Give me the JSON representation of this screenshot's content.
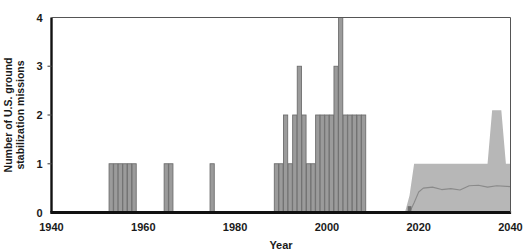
{
  "chart_data": {
    "type": "bar",
    "title": "",
    "subtitle": "",
    "xlabel": "Year",
    "ylabel": "Number of U.S. ground stabilization missions",
    "ylabel_line1": "Number of U.S. ground",
    "ylabel_line2": "stabilization missions",
    "xlim": [
      1940,
      2040
    ],
    "ylim": [
      0,
      4
    ],
    "xticks": [
      1940,
      1960,
      1980,
      2000,
      2020,
      2040
    ],
    "xtick_labels": [
      "1940",
      "1960",
      "1980",
      "2000",
      "2020",
      "2040"
    ],
    "yticks": [
      0,
      1,
      2,
      3,
      4
    ],
    "ytick_labels": [
      "0",
      "1",
      "2",
      "3",
      "4"
    ],
    "grid": false,
    "legend": null,
    "bar_color": "#9b9b9b",
    "bar_edge_color": "#6e6e6e",
    "band_color": "#b7b7b7",
    "median_line_color": "#8a8a8a",
    "axis_color": "#111111",
    "categories": [
      1953,
      1954,
      1955,
      1956,
      1957,
      1958,
      1965,
      1966,
      1975,
      1989,
      1990,
      1991,
      1992,
      1993,
      1994,
      1995,
      1996,
      1997,
      1998,
      1999,
      2000,
      2001,
      2002,
      2003,
      2004,
      2005,
      2006,
      2007,
      2008
    ],
    "values": [
      1,
      1,
      1,
      1,
      1,
      1,
      1,
      1,
      1,
      1,
      1,
      2,
      1,
      2,
      3,
      2,
      1,
      1,
      2,
      2,
      2,
      2,
      3,
      4,
      2,
      2,
      2,
      2,
      2
    ],
    "clipped_bars": [
      {
        "x": 2003,
        "value": 4,
        "note": "extends to or beyond top of axis"
      }
    ],
    "projection": {
      "label": "projected range",
      "start_year": 2017,
      "end_year": 2040,
      "upper_band": [
        {
          "year": 2017,
          "value": 0.0
        },
        {
          "year": 2018,
          "value": 0.35
        },
        {
          "year": 2019,
          "value": 1.0
        },
        {
          "year": 2020,
          "value": 1.0
        },
        {
          "year": 2025,
          "value": 1.0
        },
        {
          "year": 2030,
          "value": 1.0
        },
        {
          "year": 2035,
          "value": 1.0
        },
        {
          "year": 2036,
          "value": 2.1
        },
        {
          "year": 2038,
          "value": 2.1
        },
        {
          "year": 2039,
          "value": 1.0
        },
        {
          "year": 2040,
          "value": 1.0
        }
      ],
      "lower_band": 0.0,
      "median_line": [
        {
          "year": 2018,
          "value": 0.0
        },
        {
          "year": 2019,
          "value": 0.2
        },
        {
          "year": 2020,
          "value": 0.42
        },
        {
          "year": 2021,
          "value": 0.5
        },
        {
          "year": 2023,
          "value": 0.52
        },
        {
          "year": 2025,
          "value": 0.47
        },
        {
          "year": 2027,
          "value": 0.49
        },
        {
          "year": 2029,
          "value": 0.46
        },
        {
          "year": 2031,
          "value": 0.55
        },
        {
          "year": 2033,
          "value": 0.56
        },
        {
          "year": 2035,
          "value": 0.52
        },
        {
          "year": 2037,
          "value": 0.55
        },
        {
          "year": 2040,
          "value": 0.53
        }
      ],
      "marker_bar": {
        "year": 2018,
        "value": 0.13
      }
    }
  }
}
